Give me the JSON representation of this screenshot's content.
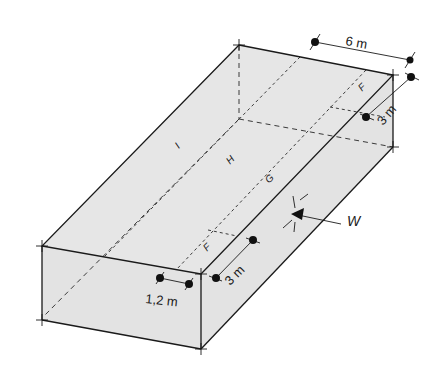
{
  "figure": {
    "title": "",
    "colors": {
      "face_fill": "#e6e6e6",
      "line": "#1a1a1a",
      "background": "#ffffff"
    }
  },
  "zones": {
    "F_back": "F",
    "F_front": "F",
    "G": "G",
    "H": "H",
    "I": "I"
  },
  "dimensions": {
    "width_top": "6 m",
    "depth_back": "3 m",
    "depth_front": "3 m",
    "edge_strip": "1,2 m"
  },
  "wind": {
    "label": "W",
    "icon": "arrow-left-icon"
  }
}
